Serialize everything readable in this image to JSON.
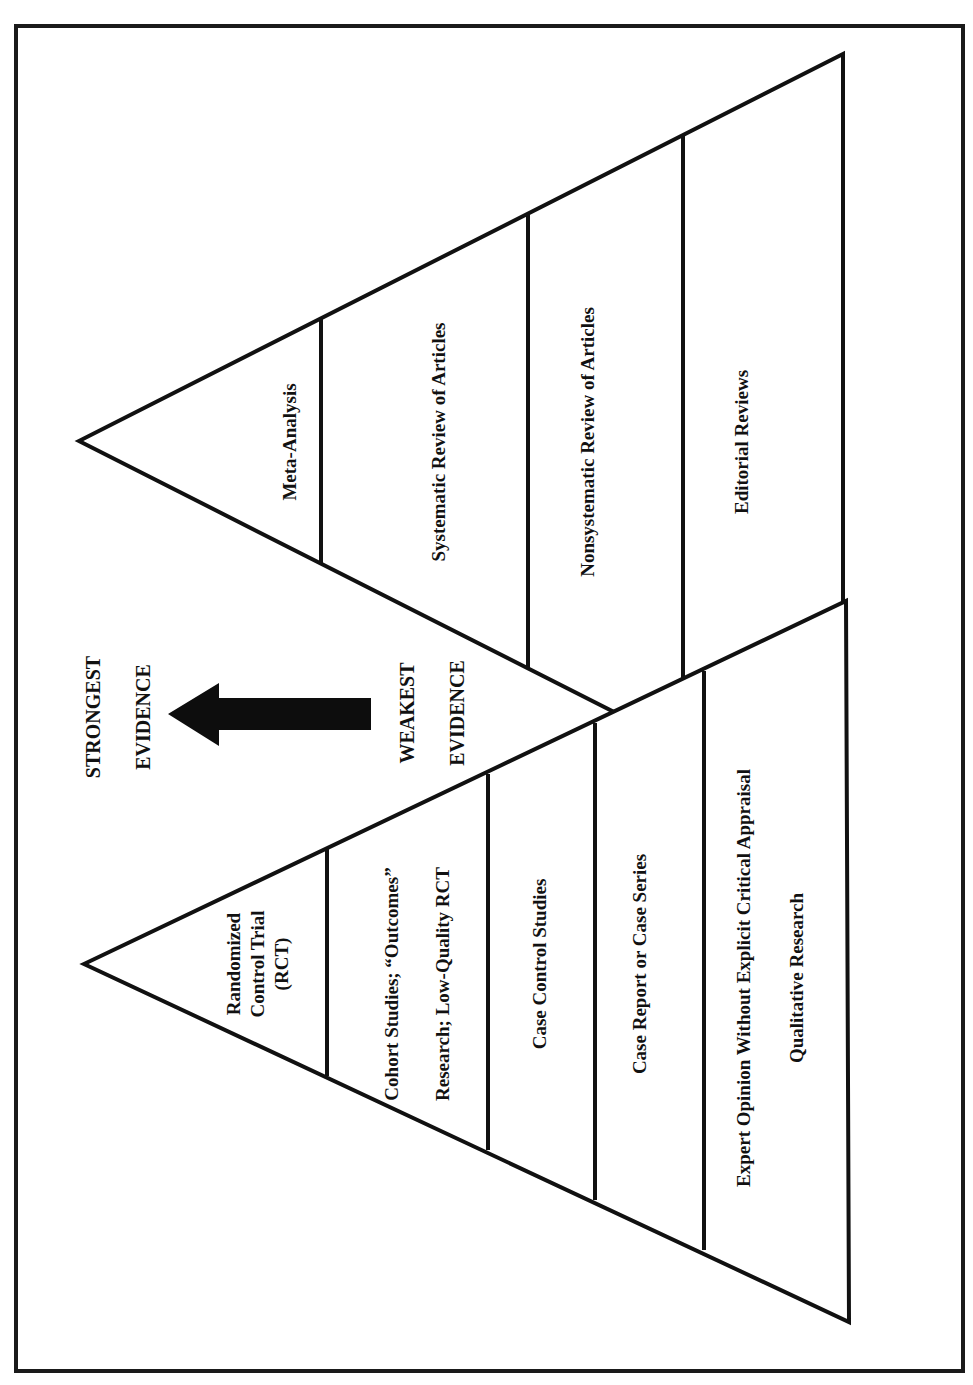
{
  "figure": {
    "orientation": "rotated-90-ccw",
    "colors": {
      "ink": "#111111",
      "background": "#ffffff",
      "arrow": "#0d0d0d"
    },
    "legend": {
      "strongest_line1": "STRONGEST",
      "strongest_line2": "EVIDENCE",
      "weakest_line1": "WEAKEST",
      "weakest_line2": "EVIDENCE",
      "arrow_icon": "arrow-left-icon",
      "arrow_direction": "toward strongest evidence"
    },
    "review_pyramid": {
      "name": "Reviews pyramid",
      "tiers": [
        {
          "rank": 1,
          "label": "Meta-Analysis"
        },
        {
          "rank": 2,
          "label": "Systematic Review of Articles"
        },
        {
          "rank": 3,
          "label": "Nonsystematic Review of Articles"
        },
        {
          "rank": 4,
          "label": "Editorial Reviews"
        }
      ]
    },
    "study_pyramid": {
      "name": "Primary studies pyramid",
      "tiers": [
        {
          "rank": 1,
          "lines": [
            "Randomized",
            "Control Trial",
            "(RCT)"
          ]
        },
        {
          "rank": 2,
          "lines": [
            "Cohort Studies; “Outcomes”",
            "Research; Low-Quality RCT"
          ]
        },
        {
          "rank": 3,
          "lines": [
            "Case Control Studies"
          ]
        },
        {
          "rank": 4,
          "lines": [
            "Case Report or Case Series"
          ]
        },
        {
          "rank": 5,
          "lines": [
            "Expert Opinion Without Explicit Critical Appraisal",
            "Qualitative Research"
          ]
        }
      ]
    }
  }
}
